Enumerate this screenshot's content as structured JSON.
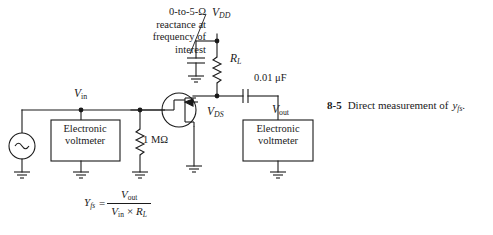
{
  "figure": {
    "title_number": "8-5",
    "caption_text": "Direct measurement of",
    "caption_symbol": "y",
    "caption_symbol_sub": "fs",
    "caption_period": "."
  },
  "annotation": {
    "lines": [
      "0-to-5-Ω",
      "reactance at",
      "frequency of",
      "interest"
    ]
  },
  "nodes": {
    "vdd": {
      "symbol": "V",
      "sub": "DD"
    },
    "vin": {
      "symbol": "V",
      "sub": "in"
    },
    "vds": {
      "symbol": "V",
      "sub": "DS"
    },
    "vout": {
      "symbol": "V",
      "sub": "out"
    }
  },
  "components": {
    "load_resistor": {
      "symbol": "R",
      "sub": "L"
    },
    "gate_resistor": {
      "value": "1 MΩ"
    },
    "coupling_capacitor": {
      "value": "0.01 μF"
    },
    "bypass_capacitor": {
      "value": ""
    },
    "source": {
      "kind": "ac-source",
      "glyph": "∼"
    },
    "transistor": {
      "kind": "jfet"
    }
  },
  "instruments": [
    {
      "name": "voltmeter-left",
      "line1": "Electronic",
      "line2": "voltmeter"
    },
    {
      "name": "voltmeter-right",
      "line1": "Electronic",
      "line2": "voltmeter"
    }
  ],
  "formula": {
    "lhs_symbol": "Y",
    "lhs_sub": "fs",
    "equals": "=",
    "numerator_symbol": "V",
    "numerator_sub": "out",
    "denominator_symbol_1": "V",
    "denominator_sub_1": "in",
    "denominator_operator": "×",
    "denominator_symbol_2": "R",
    "denominator_sub_2": "L"
  },
  "colors": {
    "ink": "#1a1a1a",
    "paper": "#ffffff"
  }
}
